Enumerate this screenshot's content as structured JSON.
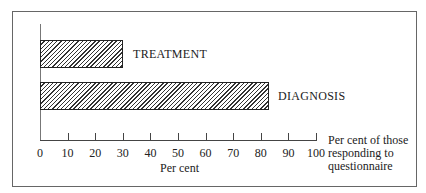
{
  "chart_data": {
    "type": "bar",
    "orientation": "horizontal",
    "categories": [
      "TREATMENT",
      "DIAGNOSIS"
    ],
    "values": [
      30,
      82
    ],
    "title": "",
    "xlabel": "Per cent",
    "xlabel_secondary": "Per cent of those responding to questionnaire",
    "ylabel": "",
    "xlim": [
      0,
      100
    ],
    "xticks": [
      0,
      10,
      20,
      30,
      40,
      50,
      60,
      70,
      80,
      90,
      100
    ],
    "grid": false,
    "legend": "none",
    "bar_fill": "diagonal hatch"
  },
  "labels": {
    "treatment": "TREATMENT",
    "diagnosis": "DIAGNOSIS",
    "xlabel": "Per cent",
    "side_line1": "Per cent of those",
    "side_line2": "responding to",
    "side_line3": "questionnaire"
  },
  "ticks": [
    "0",
    "10",
    "20",
    "30",
    "40",
    "50",
    "60",
    "70",
    "80",
    "90",
    "100"
  ]
}
